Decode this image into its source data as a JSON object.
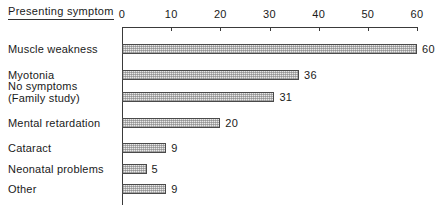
{
  "header": {
    "category_column_title": "Presenting symptom"
  },
  "chart_data": {
    "type": "bar",
    "orientation": "horizontal",
    "title": "",
    "subtitle": "",
    "xlabel": "",
    "ylabel": "Presenting symptom",
    "xlim": [
      0,
      60
    ],
    "grid": false,
    "legend": null,
    "tick_labels": [
      "0",
      "10",
      "20",
      "30",
      "40",
      "50",
      "60"
    ],
    "ticks": [
      0,
      10,
      20,
      30,
      40,
      50,
      60
    ],
    "categories": [
      "Muscle weakness",
      "Myotonia",
      "No symptoms (Family study)",
      "Mental retardation",
      "Cataract",
      "Neonatal problems",
      "Other"
    ],
    "values": [
      60,
      36,
      31,
      20,
      9,
      5,
      9
    ],
    "value_labels": [
      "60",
      "36",
      "31",
      "20",
      "9",
      "5",
      "9"
    ],
    "rows": [
      {
        "label": "Muscle weakness",
        "label_line2": "",
        "value": 60,
        "value_label": "60"
      },
      {
        "label": "Myotonia",
        "label_line2": "",
        "value": 36,
        "value_label": "36"
      },
      {
        "label": "No symptoms",
        "label_line2": "(Family study)",
        "value": 31,
        "value_label": "31"
      },
      {
        "label": "Mental retardation",
        "label_line2": "",
        "value": 20,
        "value_label": "20"
      },
      {
        "label": "Cataract",
        "label_line2": "",
        "value": 9,
        "value_label": "9"
      },
      {
        "label": "Neonatal problems",
        "label_line2": "",
        "value": 5,
        "value_label": "5"
      },
      {
        "label": "Other",
        "label_line2": "",
        "value": 9,
        "value_label": "9"
      }
    ],
    "colors": {
      "bar_fill": "#e9e9e9",
      "bar_border": "#4a4a4a",
      "axis": "#3a3a3a",
      "text": "#1a1a1a",
      "background": "#ffffff"
    }
  }
}
